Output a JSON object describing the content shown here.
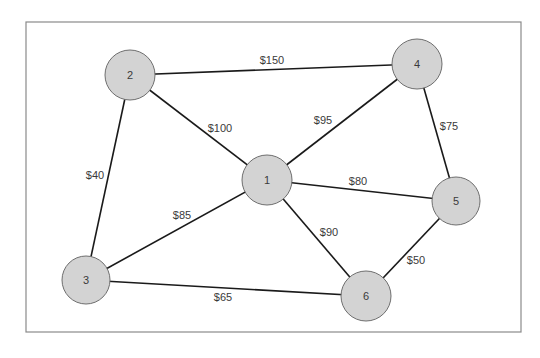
{
  "diagram": {
    "type": "weighted-network",
    "frame": {
      "x": 26,
      "y": 22,
      "width": 495,
      "height": 310
    },
    "colors": {
      "node_fill": "#d3d3d3",
      "node_stroke": "#6e6e6e",
      "edge": "#1a1a1a",
      "frame": "#8a8a8a",
      "text": "#3a3a3a"
    },
    "nodes": [
      {
        "id": "1",
        "label": "1",
        "cx": 267,
        "cy": 180,
        "r": 25
      },
      {
        "id": "2",
        "label": "2",
        "cx": 130,
        "cy": 75,
        "r": 25
      },
      {
        "id": "3",
        "label": "3",
        "cx": 86,
        "cy": 280,
        "r": 24
      },
      {
        "id": "4",
        "label": "4",
        "cx": 417,
        "cy": 64,
        "r": 25
      },
      {
        "id": "5",
        "label": "5",
        "cx": 456,
        "cy": 201,
        "r": 24
      },
      {
        "id": "6",
        "label": "6",
        "cx": 366,
        "cy": 296,
        "r": 25
      }
    ],
    "edges": [
      {
        "from": "2",
        "to": "4",
        "label": "$150",
        "lx": 272,
        "ly": 60
      },
      {
        "from": "2",
        "to": "1",
        "label": "$100",
        "lx": 220,
        "ly": 128
      },
      {
        "from": "2",
        "to": "3",
        "label": "$40",
        "lx": 95,
        "ly": 175
      },
      {
        "from": "1",
        "to": "4",
        "label": "$95",
        "lx": 323,
        "ly": 120
      },
      {
        "from": "4",
        "to": "5",
        "label": "$75",
        "lx": 449,
        "ly": 126
      },
      {
        "from": "1",
        "to": "5",
        "label": "$80",
        "lx": 358,
        "ly": 181
      },
      {
        "from": "1",
        "to": "3",
        "label": "$85",
        "lx": 182,
        "ly": 215
      },
      {
        "from": "1",
        "to": "6",
        "label": "$90",
        "lx": 329,
        "ly": 232
      },
      {
        "from": "5",
        "to": "6",
        "label": "$50",
        "lx": 416,
        "ly": 260
      },
      {
        "from": "3",
        "to": "6",
        "label": "$65",
        "lx": 223,
        "ly": 297
      }
    ]
  }
}
